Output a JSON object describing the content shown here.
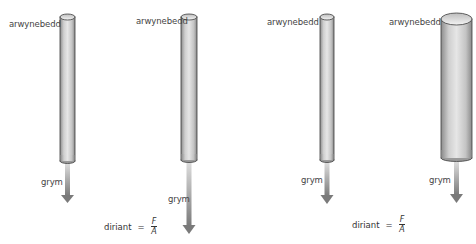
{
  "diagram": {
    "title": "",
    "panels": [
      {
        "id": "pipe-1",
        "top_label": "arwynebedd",
        "force_label": "grym",
        "formula": null,
        "pipe": {
          "x": 60,
          "top": 15,
          "bottom": 163,
          "width": 15
        },
        "arrow": {
          "from": 163,
          "to": 203
        }
      },
      {
        "id": "pipe-2",
        "top_label": "arwynebedd",
        "force_label": "grym",
        "formula": {
          "lhs": "diriant",
          "eq": "=",
          "numerator": "F",
          "denominator": "A"
        },
        "pipe": {
          "x": 181,
          "top": 15,
          "bottom": 162,
          "width": 16
        },
        "arrow": {
          "from": 162,
          "to": 234
        }
      },
      {
        "id": "pipe-3",
        "top_label": "arwynebedd",
        "force_label": "grym",
        "formula": null,
        "pipe": {
          "x": 320,
          "top": 15,
          "bottom": 162,
          "width": 14
        },
        "arrow": {
          "from": 162,
          "to": 204
        }
      },
      {
        "id": "pipe-4",
        "top_label": "arwynebedd",
        "force_label": "grym",
        "formula": {
          "lhs": "diriant",
          "eq": "=",
          "numerator": "F",
          "denominator": "A"
        },
        "pipe": {
          "x": 441,
          "top": 13,
          "bottom": 160,
          "width": 31
        },
        "arrow": {
          "from": 160,
          "to": 203
        }
      }
    ],
    "colors": {
      "pipe_light": "#e4e4e4",
      "pipe_mid": "#bcbcbc",
      "pipe_dark": "#7a7a7a",
      "pipe_outline": "#3c3c3c",
      "arrow_top": "#d6d6d6",
      "arrow_bottom": "#7d7d7d",
      "text": "#444444"
    }
  }
}
